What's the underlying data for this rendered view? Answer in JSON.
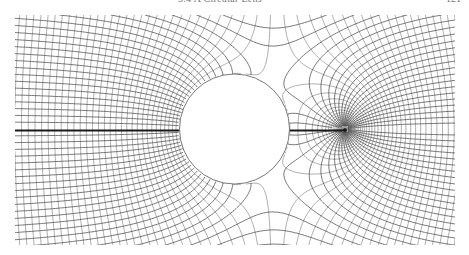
{
  "header": {
    "running_title": "3.4 A Circular Lens",
    "page_number": "121"
  },
  "figure": {
    "plot_box": {
      "x0": 15,
      "y0": 15,
      "x1": 455,
      "y1": 245
    },
    "cylinder": {
      "cx": 234.5,
      "cy": 129,
      "r": 55
    },
    "source": {
      "x": 345,
      "y": 129
    },
    "uniform_field_strength": 1.0,
    "source_strength": 55,
    "field_line_step": 7.6,
    "equipotential_step": 7.6,
    "colors": {
      "field_line": "#4a4a4a",
      "equipotential": "#8a8a8a",
      "axis_line": "#1a1a1a",
      "cylinder_edge": "#6a6a6a"
    }
  }
}
